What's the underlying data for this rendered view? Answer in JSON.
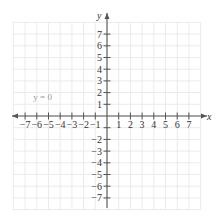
{
  "chart_data": {
    "type": "line",
    "title": "",
    "xlabel": "x",
    "ylabel": "y",
    "xlim": [
      -7,
      7
    ],
    "ylim": [
      -7,
      7
    ],
    "x_ticks": [
      -7,
      -6,
      -5,
      -4,
      -3,
      -2,
      -1,
      1,
      2,
      3,
      4,
      5,
      6,
      7
    ],
    "y_ticks": [
      7,
      6,
      5,
      4,
      3,
      2,
      1,
      -2,
      -3,
      -4,
      -5,
      -6,
      -7
    ],
    "x_tick_labels": [
      "−7",
      "−6",
      "−5",
      "−4",
      "−3",
      "−2",
      "−1",
      "1",
      "2",
      "3",
      "4",
      "5",
      "6",
      "7"
    ],
    "y_tick_labels": [
      "7",
      "6",
      "5",
      "4",
      "3",
      "2",
      "1",
      "−2",
      "−3",
      "−4",
      "−5",
      "−6",
      "−7"
    ],
    "grid": true,
    "series": [
      {
        "name": "y = 0",
        "equation": "y = 0",
        "x": [
          -7,
          7
        ],
        "y": [
          0,
          0
        ]
      }
    ],
    "annotations": [
      {
        "text": "y = 0",
        "x": -5.5,
        "y": 1.6
      }
    ],
    "legend": "none"
  },
  "colors": {
    "grid": "#ebebeb",
    "axis": "#555555",
    "text": "#333333",
    "annotation": "#999999"
  }
}
